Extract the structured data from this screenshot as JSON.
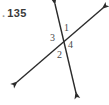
{
  "figure": {
    "problem_number": "135",
    "leader_dot": ".",
    "background_color": "#ffffff",
    "stroke_color": "#2b2b2b",
    "label_color": "#4a4a4a",
    "intersection": {
      "x": 65,
      "y": 42
    },
    "lines": [
      {
        "name": "steep-line",
        "from": {
          "x": 55,
          "y": 4
        },
        "to": {
          "x": 76,
          "y": 93
        },
        "arrowheads": "both"
      },
      {
        "name": "shallow-line",
        "from": {
          "x": 17,
          "y": 82
        },
        "to": {
          "x": 103,
          "y": 8
        },
        "arrowheads": "both"
      }
    ],
    "angle_labels": [
      {
        "id": "1",
        "text": "1",
        "position": "upper-right",
        "x": 67,
        "y": 28
      },
      {
        "id": "3",
        "text": "3",
        "position": "left",
        "x": 53,
        "y": 38
      },
      {
        "id": "4",
        "text": "4",
        "position": "right",
        "x": 71,
        "y": 45
      },
      {
        "id": "2",
        "text": "2",
        "position": "lower-left",
        "x": 60,
        "y": 55
      }
    ]
  }
}
